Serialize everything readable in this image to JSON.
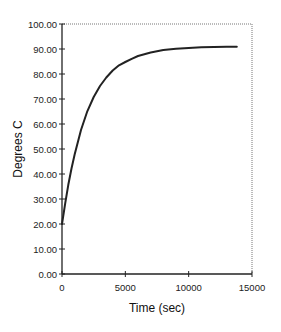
{
  "chart_data": {
    "type": "line",
    "title": "",
    "xlabel": "Time (sec)",
    "ylabel": "Degrees C",
    "xlim": [
      0,
      15000
    ],
    "ylim": [
      0,
      100
    ],
    "x_ticks": [
      0,
      5000,
      10000,
      15000
    ],
    "x_tick_labels": [
      "0",
      "5000",
      "10000",
      "15000"
    ],
    "y_ticks": [
      0,
      10,
      20,
      30,
      40,
      50,
      60,
      70,
      80,
      90,
      100
    ],
    "y_tick_labels": [
      "0.00",
      "10.00",
      "20.00",
      "30.00",
      "40.00",
      "50.00",
      "60.00",
      "70.00",
      "80.00",
      "90.00",
      "100.00"
    ],
    "grid": false,
    "legend": "none",
    "frame": "dotted top and right border",
    "series": [
      {
        "name": "Temperature",
        "color": "#222222",
        "x": [
          0,
          250,
          500,
          750,
          1000,
          1500,
          2000,
          2500,
          3000,
          3500,
          4000,
          4500,
          5000,
          5500,
          6000,
          7000,
          8000,
          9000,
          10000,
          11000,
          12000,
          13000,
          13800
        ],
        "y": [
          20.0,
          28.3,
          35.7,
          42.2,
          47.9,
          57.6,
          65.1,
          70.8,
          75.2,
          78.6,
          81.4,
          83.5,
          84.8,
          86.1,
          87.2,
          88.6,
          89.6,
          90.1,
          90.4,
          90.7,
          90.8,
          90.9,
          90.9
        ]
      }
    ]
  }
}
